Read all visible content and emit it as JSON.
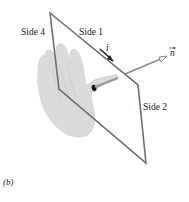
{
  "figure": {
    "panel_label": "(b)",
    "labels": {
      "side1": "Side 1",
      "side2": "Side 2",
      "side4": "Side 4",
      "current": "i",
      "normal": "n"
    },
    "colors": {
      "loop_edge": "#6e6e6e",
      "hand_fill": "#d9d9d9",
      "hand_shadow": "#c4c4c4",
      "normal_arrow": "#8a8a8a",
      "current_arrow": "#222222",
      "text": "#222222"
    }
  }
}
